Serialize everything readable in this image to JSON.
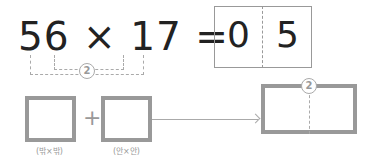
{
  "equation": {
    "left_operand": "56",
    "operator": "×",
    "right_operand": "17",
    "equals": "=",
    "answer_digits": [
      "0",
      "5"
    ]
  },
  "bracket_label": "2",
  "diagram": {
    "box1_label": "(밖×밖)",
    "plus": "+",
    "box2_label": "(안×안)",
    "result_marker": "2"
  },
  "colors": {
    "text": "#222222",
    "guide": "#999999"
  }
}
